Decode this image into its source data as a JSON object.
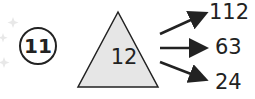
{
  "problem_number": "11",
  "triangle_value": "12",
  "outputs": [
    "112",
    "63",
    "24"
  ],
  "colors": {
    "triangle_fill": "#e6e6e6",
    "stroke": "#222222"
  }
}
